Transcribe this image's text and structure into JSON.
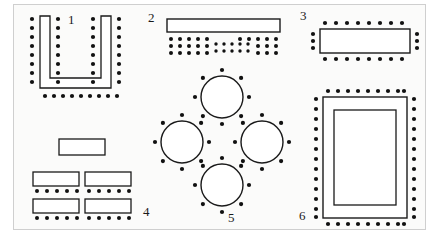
{
  "diagram": {
    "type": "floor-plan-layouts",
    "stroke_color": "#1a1a1a",
    "seat_color": "#111111",
    "table_fill": "#ffffff",
    "frame_color": "#cfcfcf",
    "background": "#fbfbfa",
    "layouts": [
      {
        "number": "1",
        "name": "u-shape",
        "style": "U-Shape",
        "label_x": 68,
        "label_y": 19,
        "tables": 1,
        "seats_total": 41,
        "seat_groups": [
          {
            "position": "outer-left-column",
            "count": 8
          },
          {
            "position": "inner-left-column",
            "count": 8
          },
          {
            "position": "inner-right-column",
            "count": 8
          },
          {
            "position": "outer-right-column",
            "count": 8
          },
          {
            "position": "bottom-outer-row",
            "count": 9
          }
        ]
      },
      {
        "number": "2",
        "name": "theater-classroom",
        "style": "Theater / Audience",
        "label_x": 148,
        "label_y": 15,
        "tables": 1,
        "seats_total": 40,
        "seat_groups": [
          {
            "position": "left-block",
            "rows": 3,
            "cols": 5,
            "count": 15
          },
          {
            "position": "center-block",
            "rows": 2,
            "cols": 5,
            "count": 10
          },
          {
            "position": "right-block",
            "rows": 3,
            "cols": 5,
            "count": 15
          }
        ]
      },
      {
        "number": "3",
        "name": "boardroom",
        "style": "Boardroom / Conference",
        "label_x": 300,
        "label_y": 12,
        "tables": 1,
        "seats_total": 22,
        "seat_groups": [
          {
            "position": "top-row",
            "count": 8
          },
          {
            "position": "bottom-row",
            "count": 8
          },
          {
            "position": "left-column",
            "count": 3
          },
          {
            "position": "right-column",
            "count": 3
          }
        ]
      },
      {
        "number": "4",
        "name": "classroom",
        "style": "Classroom",
        "label_x": 144,
        "label_y": 210,
        "tables": 5,
        "seats_total": 20,
        "seat_groups": [
          {
            "position": "row-1-left-table",
            "count": 5
          },
          {
            "position": "row-1-right-table",
            "count": 5
          },
          {
            "position": "row-2-left-table",
            "count": 5
          },
          {
            "position": "row-2-right-table",
            "count": 5
          }
        ]
      },
      {
        "number": "5",
        "name": "banquet-rounds",
        "style": "Banquet Rounds",
        "label_x": 228,
        "label_y": 213,
        "tables": 4,
        "seats_total": 32,
        "seat_groups": [
          {
            "position": "top-round-table",
            "count": 8
          },
          {
            "position": "left-round-table",
            "count": 8
          },
          {
            "position": "right-round-table",
            "count": 8
          },
          {
            "position": "bottom-round-table",
            "count": 8
          }
        ]
      },
      {
        "number": "6",
        "name": "hollow-square",
        "style": "Hollow Square",
        "label_x": 300,
        "label_y": 211,
        "tables": 1,
        "seats_total": 44,
        "seat_groups": [
          {
            "position": "top-row",
            "count": 9
          },
          {
            "position": "bottom-row",
            "count": 9
          },
          {
            "position": "left-column",
            "count": 13
          },
          {
            "position": "right-column",
            "count": 13
          }
        ]
      }
    ]
  }
}
